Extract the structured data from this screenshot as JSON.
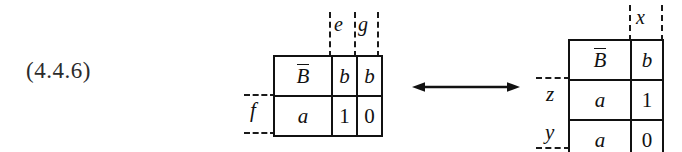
{
  "figure": {
    "equation_number": "(4.4.6)",
    "arrow": {
      "name": "double-headed-arrow",
      "direction": "bidirectional",
      "color": "#111111"
    },
    "colors": {
      "ink": "#111111",
      "background": "#ffffff",
      "dash": "#1a1a1a"
    }
  },
  "left_table": {
    "rows": [
      {
        "cells": [
          "B̅",
          "b",
          "b"
        ]
      },
      {
        "cells": [
          "a",
          "1",
          "0"
        ]
      }
    ],
    "column_labels": [
      "e",
      "g"
    ],
    "row_labels": [
      "f"
    ]
  },
  "right_table": {
    "rows": [
      {
        "cells": [
          "B̅",
          "b"
        ]
      },
      {
        "cells": [
          "a",
          "1"
        ]
      },
      {
        "cells": [
          "a",
          "0"
        ]
      }
    ],
    "column_labels": [
      "x"
    ],
    "row_labels": [
      "z",
      "y"
    ]
  }
}
